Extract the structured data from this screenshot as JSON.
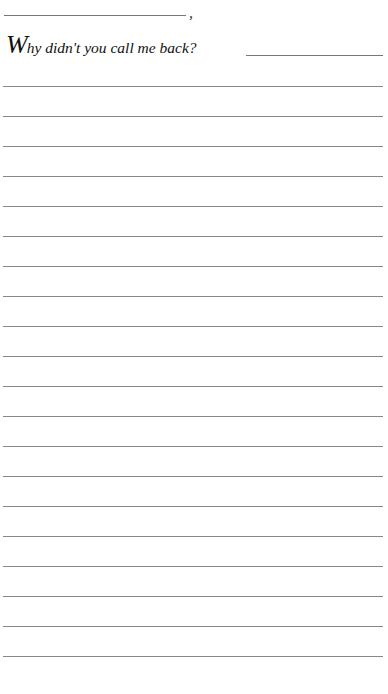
{
  "page": {
    "salutation": {
      "comma": ","
    },
    "prompt": {
      "drop_cap": "W",
      "text": "hy didn't you call me back?"
    },
    "writing_lines": {
      "count": 20
    },
    "colors": {
      "background": "#ffffff",
      "line": "#888888",
      "text": "#111111"
    }
  }
}
